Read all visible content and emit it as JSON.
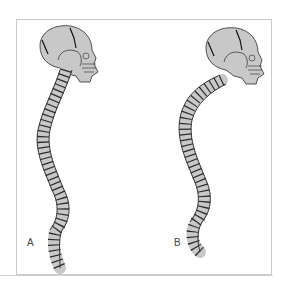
{
  "figure": {
    "panels": [
      {
        "label": "A",
        "description": "Normal spinal curvature, lateral view with skull"
      },
      {
        "label": "B",
        "description": "Exaggerated thoracic curvature (kyphosis), lateral view with skull"
      }
    ]
  },
  "colors": {
    "bone_fill": "#c8c8c8",
    "outline": "#2a2a2a",
    "frame": "#c9c9c9",
    "background": "#ffffff"
  }
}
